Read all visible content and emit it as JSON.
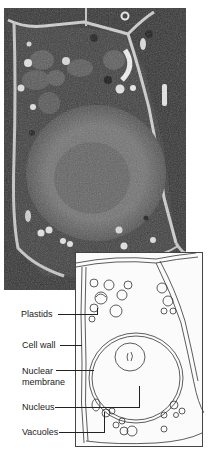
{
  "figure": {
    "photo": {
      "description": "electron micrograph of plant cell",
      "tone": "#3a3a3a"
    },
    "diagram": {
      "description": "line drawing of plant cell"
    },
    "labels": [
      {
        "id": "plastids",
        "text": "Plastids"
      },
      {
        "id": "cell-wall",
        "text": "Cell wall"
      },
      {
        "id": "nuclear-membrane-1",
        "text": "Nuclear"
      },
      {
        "id": "nuclear-membrane-2",
        "text": "membrane"
      },
      {
        "id": "nucleus",
        "text": "Nucleus"
      },
      {
        "id": "vacuoles",
        "text": "Vacuoles"
      }
    ]
  }
}
